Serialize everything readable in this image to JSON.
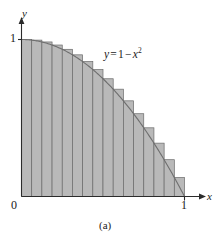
{
  "figure": {
    "caption": "(a)",
    "equation": {
      "lhs": "y",
      "eq": "=",
      "one": "1",
      "minus": "−",
      "var": "x",
      "exponent": "2",
      "full": "y = 1 − x²"
    },
    "axis_labels": {
      "x": "x",
      "y": "y"
    },
    "tick_labels": {
      "x": [
        "0",
        "1"
      ],
      "y": [
        "1"
      ]
    },
    "colors": {
      "bar_fill": "#b9b9b9",
      "bar_stroke": "#6a6a6a",
      "curve": "#6e6e6e",
      "axis": "#2b2b2b",
      "background": "#ffffff"
    }
  },
  "chart_data": {
    "type": "area",
    "title": "",
    "subtitle": "",
    "caption": "(a)",
    "xlabel": "x",
    "ylabel": "y",
    "xlim": [
      0,
      1
    ],
    "ylim": [
      0,
      1
    ],
    "xticks": [
      0,
      1
    ],
    "xticklabels": [
      "0",
      "1"
    ],
    "yticks": [
      1
    ],
    "yticklabels": [
      "1"
    ],
    "grid": false,
    "legend": null,
    "annotations": [
      {
        "text": "y = 1 − x²",
        "x": 0.52,
        "y": 0.82
      }
    ],
    "function": {
      "expression": "y = 1 - x^2",
      "domain": [
        0,
        1
      ],
      "sampled_x": [
        0.0,
        0.1,
        0.2,
        0.3,
        0.4,
        0.5,
        0.6,
        0.7,
        0.8,
        0.9,
        1.0
      ],
      "sampled_y": [
        1.0,
        0.99,
        0.96,
        0.91,
        0.84,
        0.75,
        0.64,
        0.51,
        0.36,
        0.19,
        0.0
      ]
    },
    "riemann_sum": {
      "kind": "circumscribed-upper-rectangles",
      "n": 16,
      "interval": [
        0,
        1
      ],
      "delta_x": 0.0625,
      "left_edges": [
        0.0,
        0.0625,
        0.125,
        0.1875,
        0.25,
        0.3125,
        0.375,
        0.4375,
        0.5,
        0.5625,
        0.625,
        0.6875,
        0.75,
        0.8125,
        0.875,
        0.9375
      ],
      "heights": [
        1.0,
        0.996094,
        0.984375,
        0.964844,
        0.9375,
        0.902344,
        0.859375,
        0.808594,
        0.75,
        0.683594,
        0.609375,
        0.527344,
        0.4375,
        0.339844,
        0.234375,
        0.121094
      ]
    }
  }
}
